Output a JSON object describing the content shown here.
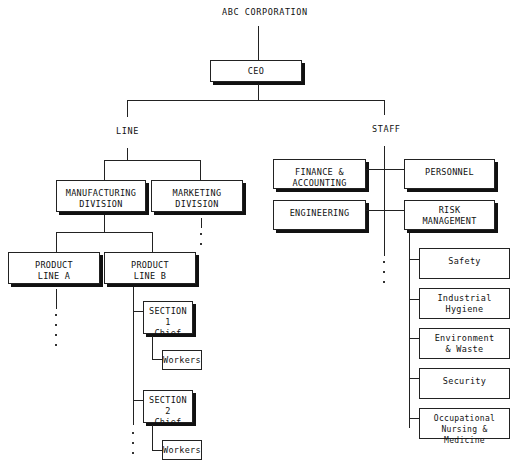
{
  "title": "ABC CORPORATION",
  "ceo": "CEO",
  "branches": {
    "line": "LINE",
    "staff": "STAFF"
  },
  "line": {
    "manufacturing": "MANUFACTURING\nDIVISION",
    "marketing": "MARKETING\nDIVISION",
    "product_line_a": "PRODUCT\nLINE A",
    "product_line_b": "PRODUCT\nLINE B",
    "sections": [
      {
        "chief": "SECTION 1\nChief",
        "workers": "Workers"
      },
      {
        "chief": "SECTION 2\nChief",
        "workers": "Workers"
      }
    ]
  },
  "staff": {
    "finance": "FINANCE &\nACCOUNTING",
    "personnel": "PERSONNEL",
    "engineering": "ENGINEERING",
    "risk_management": "RISK\nMANAGEMENT",
    "risk_units": [
      "Safety",
      "Industrial\nHygiene",
      "Environment\n& Waste",
      "Security",
      "Occupational\nNursing & Medicine"
    ]
  }
}
